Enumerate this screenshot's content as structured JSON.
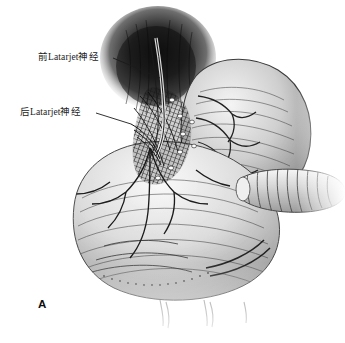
{
  "figure": {
    "panel_letter": "A",
    "background_color": "#ffffff",
    "ink_color": "#1b1b1b",
    "width": 345,
    "height": 343,
    "labels": [
      {
        "id": "anterior-latarjet-nerve",
        "text": "前Latarjet神经",
        "x": 38,
        "y": 53,
        "leader": {
          "x1": 113,
          "y1": 58,
          "x2": 160,
          "y2": 78
        }
      },
      {
        "id": "posterior-latarjet-nerve",
        "text": "后Latarjet神经",
        "x": 20,
        "y": 108,
        "leader": {
          "x1": 96,
          "y1": 113,
          "x2": 131,
          "y2": 124
        }
      }
    ],
    "regions": [
      {
        "id": "esophageal-hiatus-shadow",
        "cx": 158,
        "cy": 56,
        "rx": 56,
        "ry": 50,
        "tone": "#2f2f2f"
      },
      {
        "id": "gastric-fundus",
        "cx": 238,
        "cy": 130,
        "rx": 72,
        "ry": 68,
        "tone": "#b9b9b9"
      },
      {
        "id": "gastric-body-antrum",
        "cx": 168,
        "cy": 222,
        "rx": 108,
        "ry": 78,
        "tone": "#c6c6c6"
      },
      {
        "id": "duodenal-tube-instrument",
        "cx": 288,
        "cy": 192,
        "rx": 58,
        "ry": 21,
        "tone": "#d2d2d2"
      },
      {
        "id": "lesser-curvature-dissection",
        "cx": 170,
        "cy": 130,
        "rx": 22,
        "ry": 48,
        "tone": "#3a3a3a"
      }
    ],
    "nerve_trunk": {
      "id": "anterior-vagal-trunk",
      "points": "158,40 160,64 162,90 163,112 160,136"
    }
  }
}
